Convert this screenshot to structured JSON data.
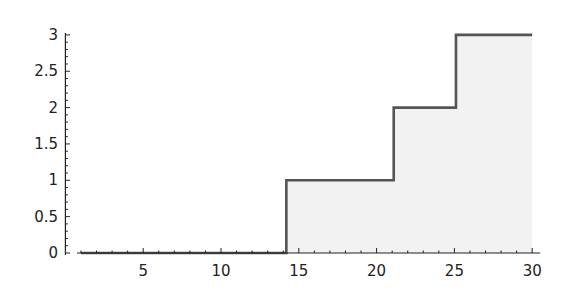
{
  "chart_data": {
    "type": "line",
    "subtype": "step-area",
    "title": "",
    "xlabel": "",
    "ylabel": "",
    "xlim": [
      0,
      30
    ],
    "ylim": [
      0,
      3
    ],
    "x_ticks": [
      5,
      10,
      15,
      20,
      25,
      30
    ],
    "x_tick_labels": [
      "5",
      "10",
      "15",
      "20",
      "25",
      "30"
    ],
    "y_ticks": [
      0,
      0.5,
      1,
      1.5,
      2,
      2.5,
      3
    ],
    "y_tick_labels": [
      "0",
      "0.5",
      "1",
      "1.5",
      "2",
      "2.5",
      "3"
    ],
    "grid": false,
    "legend": null,
    "series": [
      {
        "name": "step",
        "points": [
          {
            "x": 1,
            "y": 0
          },
          {
            "x": 14.2,
            "y": 0
          },
          {
            "x": 14.2,
            "y": 1
          },
          {
            "x": 21.1,
            "y": 1
          },
          {
            "x": 21.1,
            "y": 2
          },
          {
            "x": 25.1,
            "y": 2
          },
          {
            "x": 25.1,
            "y": 3
          },
          {
            "x": 30,
            "y": 3
          }
        ],
        "line_color": "#555555",
        "fill_color": "#f2f2f2"
      }
    ]
  }
}
